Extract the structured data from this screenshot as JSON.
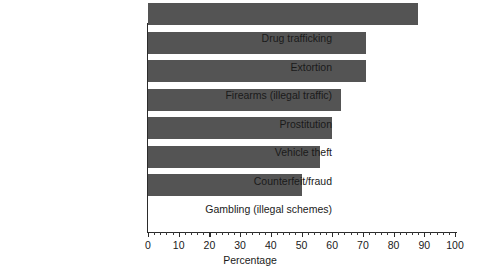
{
  "chart_data": {
    "type": "bar",
    "orientation": "horizontal",
    "title": "",
    "subtitle": "",
    "xlabel": "Percentage",
    "ylabel": "",
    "xlim": [
      0,
      100
    ],
    "grid": false,
    "legend": null,
    "categories": [
      "Drug trafficking",
      "Extortion",
      "Firearms (illegal traffic)",
      "Prostitution",
      "Vehicle theft",
      "Counterfeit/fraud",
      "Gambling (illegal schemes)"
    ],
    "values": [
      88,
      71,
      71,
      63,
      60,
      56,
      50
    ],
    "xticks": [
      0,
      10,
      20,
      30,
      40,
      50,
      60,
      70,
      80,
      90,
      100
    ],
    "xtick_labels": [
      "0",
      "10",
      "20",
      "30",
      "40",
      "50",
      "60",
      "70",
      "80",
      "90",
      "100"
    ],
    "minor_tick_step": 2,
    "bar_color": "#545454",
    "axis_color": "#2b2b2b",
    "background_color": "#ffffff"
  }
}
